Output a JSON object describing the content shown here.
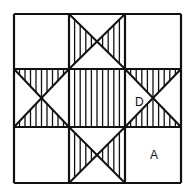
{
  "diagram": {
    "type": "quilt-block",
    "grid": {
      "rows": 3,
      "cols": 3,
      "x": [
        14,
        69,
        125,
        181
      ],
      "y": [
        14,
        69,
        127,
        183
      ]
    },
    "stroke_color": "#111111",
    "background": "#ffffff",
    "labels": [
      {
        "id": "D",
        "text": "D",
        "x": 135,
        "y": 106
      },
      {
        "id": "A",
        "text": "A",
        "x": 150,
        "y": 159
      }
    ],
    "cells": [
      {
        "row": 0,
        "col": 0,
        "pattern": "plain"
      },
      {
        "row": 0,
        "col": 1,
        "pattern": "x-hatch-left-right"
      },
      {
        "row": 0,
        "col": 2,
        "pattern": "plain"
      },
      {
        "row": 1,
        "col": 0,
        "pattern": "x-hatch-top-bottom"
      },
      {
        "row": 1,
        "col": 1,
        "pattern": "full-hatch"
      },
      {
        "row": 1,
        "col": 2,
        "pattern": "x-hatch-top-bottom"
      },
      {
        "row": 2,
        "col": 0,
        "pattern": "plain"
      },
      {
        "row": 2,
        "col": 1,
        "pattern": "x-hatch-left-right"
      },
      {
        "row": 2,
        "col": 2,
        "pattern": "plain"
      }
    ]
  }
}
